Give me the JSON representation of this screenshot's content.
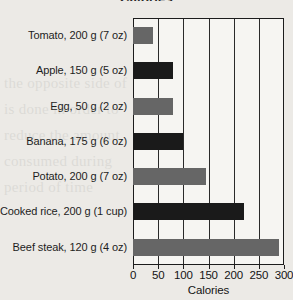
{
  "chart_data": {
    "type": "bar",
    "orientation": "horizontal",
    "title": "Calories",
    "xlabel": "Calories",
    "ylabel": "",
    "xlim": [
      0,
      300
    ],
    "xticks": [
      0,
      50,
      100,
      150,
      200,
      250,
      300
    ],
    "xtick_labels": [
      "0",
      "50",
      "100",
      "150",
      "200",
      "250",
      "300"
    ],
    "grid": "vertical",
    "legend": "none",
    "categories": [
      "Tomato, 200 g (7 oz)",
      "Apple, 150 g (5 oz)",
      "Egg, 50 g (2 oz)",
      "Banana, 175 g (6 oz)",
      "Potato, 200 g (7 oz)",
      "Cooked rice, 200 g (1 cup)",
      "Beef steak, 120 g (4 oz)"
    ],
    "values": [
      40,
      80,
      80,
      100,
      145,
      220,
      290
    ],
    "bar_colors": [
      "#666666",
      "#1a1a1a",
      "#666666",
      "#1a1a1a",
      "#666666",
      "#1a1a1a",
      "#666666"
    ],
    "colors": {
      "bar_gray": "#666666",
      "bar_dark": "#1a1a1a",
      "axis": "#1c1c1c",
      "plot_background": "#f6f5f2",
      "page_background": "#eceae6",
      "text": "#1d1d1d"
    }
  },
  "bleed_text": [
    "the opposite side of",
    "is done in order to",
    "reduce the amount",
    "consumed during",
    "period of time"
  ]
}
